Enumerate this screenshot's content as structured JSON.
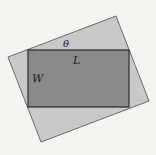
{
  "diagram": {
    "labels": {
      "angle": "θ",
      "length": "L",
      "width": "W"
    },
    "colors": {
      "background": "#f4f4f2",
      "outer_square_fill": "#c9c9c9",
      "outer_square_stroke": "#6a6a6a",
      "inner_rect_fill": "#8a8a8a",
      "inner_rect_stroke": "#2a2a2a"
    },
    "outer_square": {
      "points": [
        [
          8,
          57
        ],
        [
          116,
          16
        ],
        [
          149,
          101
        ],
        [
          41,
          142
        ]
      ]
    },
    "inner_rectangle": {
      "x": 28,
      "y": 50,
      "width": 101,
      "height": 57
    }
  }
}
